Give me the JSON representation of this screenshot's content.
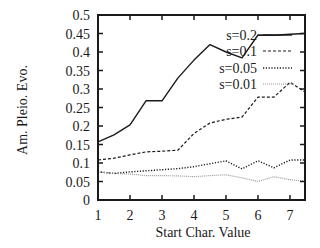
{
  "chart_data": {
    "type": "line",
    "title": "",
    "xlabel": "Start Char. Value",
    "ylabel": "Am. Pleio. Evo.",
    "xlim": [
      1,
      7.47
    ],
    "ylim": [
      0,
      0.5
    ],
    "xticks": [
      1,
      2,
      3,
      4,
      5,
      6,
      7
    ],
    "xtick_labels": [
      "1",
      "2",
      "3",
      "4",
      "5",
      "6",
      "7"
    ],
    "yticks": [
      0,
      0.05,
      0.1,
      0.15,
      0.2,
      0.25,
      0.3,
      0.35,
      0.4,
      0.45,
      0.5
    ],
    "ytick_labels": [
      "0",
      "0.05",
      "0.1",
      "0.15",
      "0.2",
      "0.25",
      "0.3",
      "0.35",
      "0.4",
      "0.45",
      "0.5"
    ],
    "grid": false,
    "legend_position": "upper right (inside)",
    "series": [
      {
        "name": "s=0.2",
        "style": "solid",
        "color": "#1a1a1a",
        "x": [
          1,
          1.5,
          2,
          2.5,
          3,
          3.5,
          4,
          4.5,
          5,
          5.5,
          6,
          6.5,
          7,
          7.47
        ],
        "values": [
          0.157,
          0.176,
          0.203,
          0.268,
          0.268,
          0.33,
          0.378,
          0.42,
          0.4,
          0.384,
          0.446,
          0.445,
          0.448,
          0.45
        ]
      },
      {
        "name": "s=0.1",
        "style": "dashed",
        "color": "#1a1a1a",
        "x": [
          1,
          1.5,
          2,
          2.5,
          3,
          3.5,
          4,
          4.5,
          5,
          5.5,
          6,
          6.5,
          7,
          7.47
        ],
        "values": [
          0.108,
          0.113,
          0.122,
          0.13,
          0.132,
          0.135,
          0.18,
          0.208,
          0.218,
          0.224,
          0.278,
          0.278,
          0.318,
          0.292
        ]
      },
      {
        "name": "s=0.05",
        "style": "dotted",
        "color": "#1a1a1a",
        "x": [
          1,
          1.5,
          2,
          2.5,
          3,
          3.5,
          4,
          4.5,
          5,
          5.5,
          6,
          6.5,
          7,
          7.47
        ],
        "values": [
          0.076,
          0.072,
          0.076,
          0.079,
          0.082,
          0.085,
          0.09,
          0.098,
          0.106,
          0.084,
          0.106,
          0.087,
          0.108,
          0.108
        ]
      },
      {
        "name": "s=0.01",
        "style": "dotted-light",
        "color": "#9a9a9a",
        "x": [
          1,
          1.5,
          2,
          2.5,
          3,
          3.5,
          4,
          4.5,
          5,
          5.5,
          6,
          6.5,
          7,
          7.47
        ],
        "values": [
          0.076,
          0.072,
          0.07,
          0.066,
          0.066,
          0.065,
          0.063,
          0.066,
          0.068,
          0.06,
          0.05,
          0.063,
          0.055,
          0.051
        ]
      }
    ]
  },
  "layout": {
    "plot_left": 98,
    "plot_right": 305,
    "plot_top": 15,
    "plot_bottom": 200
  }
}
